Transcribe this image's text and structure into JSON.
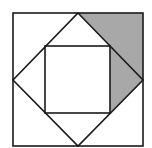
{
  "diagram": {
    "title": "",
    "colors": {
      "background": "#ffffff",
      "stroke": "#1a1a1a",
      "shade": "#a8a8a8"
    },
    "outer_square": {
      "x1": 13,
      "y1": 13,
      "x2": 143,
      "y2": 146
    },
    "diamond": {
      "top": [
        78,
        13
      ],
      "right": [
        143,
        80
      ],
      "bottom": [
        78,
        146
      ],
      "left": [
        13,
        80
      ]
    },
    "inner_square": {
      "x1": 45,
      "y1": 46,
      "x2": 110,
      "y2": 113
    },
    "shaded_region": [
      [
        78,
        13
      ],
      [
        143,
        13
      ],
      [
        143,
        80
      ],
      [
        110,
        113
      ],
      [
        110,
        46
      ]
    ]
  }
}
